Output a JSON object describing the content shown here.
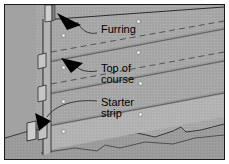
{
  "figure": {
    "type": "technical-illustration",
    "width": 229,
    "height": 164,
    "border_color": "#1a1a1a",
    "background_color": "#ffffff"
  },
  "colors": {
    "wall_field": "#a8a8a8",
    "siding_face": "#9d9d9d",
    "siding_shadow": "#8a8a8a",
    "furring_light": "#c8c8c8",
    "furring_dark": "#707070",
    "ground": "#9a9a9a",
    "line": "#2b2b2b",
    "arrow": "#000000",
    "nail": "#ffffff",
    "leader": "#3a3a3a"
  },
  "labels": [
    {
      "id": "furring",
      "text": "Furring",
      "x": 96,
      "y": 19,
      "points_to": "vertical-furring-strip"
    },
    {
      "id": "top-of-course",
      "text": "Top of\ncourse",
      "line1": "Top of",
      "line2": "course",
      "x": 96,
      "y": 58,
      "points_to": "siding-course-top-edge"
    },
    {
      "id": "starter-strip",
      "text": "Starter\nstrip",
      "line1": "Starter",
      "line2": "strip",
      "x": 96,
      "y": 92,
      "points_to": "starter-strip-block"
    }
  ],
  "callouts": {
    "arrow_count": 3,
    "arrow_color": "#000000",
    "leader_style": "curved-thin"
  },
  "elements": {
    "siding_courses": 4,
    "nail_markers": 8,
    "furring_strips": 4,
    "starter_strip_blocks": 2,
    "ground_line": "irregular-grade"
  }
}
